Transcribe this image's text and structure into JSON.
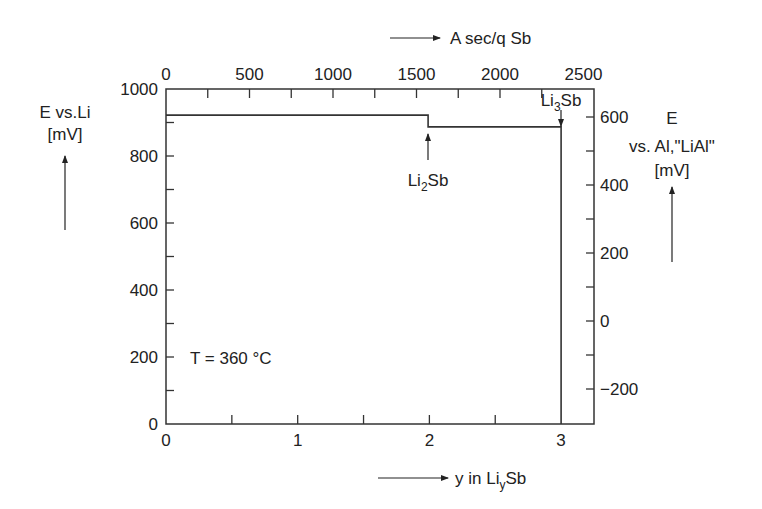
{
  "chart_data": {
    "type": "line",
    "title": "",
    "annotation_temperature": "T = 360 °C",
    "x_bottom": {
      "label_prefix": "y in Li",
      "label_sub": "y",
      "label_suffix": "Sb",
      "range": [
        0,
        3.25
      ],
      "ticks": [
        "0",
        "1",
        "2",
        "3"
      ],
      "tick_values": [
        0,
        1,
        2,
        3
      ]
    },
    "x_top": {
      "label": "A sec/q Sb",
      "range": [
        0,
        2615
      ],
      "ticks": [
        "0",
        "500",
        "1000",
        "1500",
        "2000",
        "2500"
      ],
      "tick_values": [
        0,
        500,
        1000,
        1500,
        2000,
        2500
      ]
    },
    "y_left": {
      "label_line1": "E vs.Li",
      "label_line2": "[mV]",
      "range": [
        0,
        1000
      ],
      "ticks": [
        "0",
        "200",
        "400",
        "600",
        "800",
        "1000"
      ],
      "tick_values": [
        0,
        200,
        400,
        600,
        800,
        1000
      ]
    },
    "y_right": {
      "label_line1": "E",
      "label_line2": "vs. Al,\"LiAl\"",
      "label_line3": "[mV]",
      "ticks": [
        "600",
        "400",
        "200",
        "0",
        "−200"
      ],
      "tick_values": [
        600,
        400,
        200,
        0,
        -200
      ]
    },
    "series": [
      {
        "name": "Coulometric titration curve",
        "x": [
          0,
          1.99,
          1.99,
          3.0,
          3.0
        ],
        "y": [
          922,
          922,
          887,
          887,
          0
        ]
      }
    ],
    "annotations": [
      {
        "text_main": "Li",
        "text_sub": "2",
        "text_tail": "Sb",
        "x": 2.0,
        "y": 887
      },
      {
        "text_main": "Li",
        "text_sub": "3",
        "text_tail": "Sb",
        "x": 3.0,
        "y": 887
      }
    ],
    "grid": false,
    "legend": "none"
  }
}
